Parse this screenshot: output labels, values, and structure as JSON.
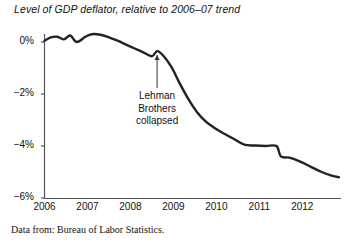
{
  "chart_data": {
    "type": "line",
    "title": "Level of GDP deflator, relative to 2006–07 trend",
    "xlabel": "",
    "ylabel": "",
    "xlim": [
      2006,
      2012.9
    ],
    "ylim": [
      -6,
      0.7
    ],
    "grid": false,
    "legend": "none",
    "yticks": [
      0,
      -2,
      -4,
      -6
    ],
    "ytick_labels": [
      "0%",
      "−2%",
      "−4%",
      "−6%"
    ],
    "xticks": [
      2006,
      2007,
      2008,
      2009,
      2010,
      2011,
      2012
    ],
    "xtick_labels": [
      "2006",
      "2007",
      "2008",
      "2009",
      "2010",
      "2011",
      "2012"
    ],
    "series": [
      {
        "name": "Level of GDP deflator relative to 2006-07 trend",
        "color": "#222222",
        "x": [
          2006.0,
          2006.15,
          2006.3,
          2006.45,
          2006.6,
          2006.75,
          2006.95,
          2007.1,
          2007.3,
          2007.5,
          2007.7,
          2007.9,
          2008.1,
          2008.3,
          2008.5,
          2008.62,
          2008.75,
          2008.95,
          2009.15,
          2009.35,
          2009.55,
          2009.75,
          2009.95,
          2010.15,
          2010.4,
          2010.65,
          2010.9,
          2011.15,
          2011.4,
          2011.5,
          2011.7,
          2011.95,
          2012.2,
          2012.45,
          2012.7,
          2012.85
        ],
        "y": [
          0.05,
          0.18,
          0.2,
          0.1,
          0.25,
          0.0,
          0.2,
          0.3,
          0.28,
          0.18,
          0.05,
          -0.1,
          -0.25,
          -0.4,
          -0.55,
          -0.35,
          -0.5,
          -0.95,
          -1.6,
          -2.2,
          -2.7,
          -3.05,
          -3.3,
          -3.5,
          -3.72,
          -3.95,
          -3.98,
          -4.0,
          -4.0,
          -4.4,
          -4.45,
          -4.6,
          -4.8,
          -5.0,
          -5.15,
          -5.2
        ]
      }
    ],
    "annotations": [
      {
        "name": "lehman-collapse",
        "lines": [
          "Lehman",
          "Brothers",
          "collapsed"
        ],
        "points_to_x": 2008.62,
        "points_to_y": -0.35,
        "arrow": "up"
      }
    ],
    "caption": "Data from: Bureau of Labor Statistics."
  },
  "colors": {
    "line": "#222222",
    "axis": "#555555",
    "text": "#111111",
    "background": "#ffffff"
  }
}
